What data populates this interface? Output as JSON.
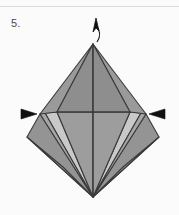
{
  "page": {
    "width": 179,
    "height": 215,
    "background_color": "#fbfbfb",
    "rule_color": "#d8dadd"
  },
  "step": {
    "number_label": "5."
  },
  "figure": {
    "title": "origami-kite-base-step-5",
    "stroke_color": "#3a3a3a",
    "stroke_width": 1.1,
    "arrow_color": "#111111",
    "colors": {
      "upper_face_left": "#8e8e8e",
      "upper_face_right": "#8e8e8e",
      "upper_wing_left": "#9a9a9a",
      "upper_wing_right": "#9a9a9a",
      "flap_outer_left": "#949494",
      "flap_outer_right": "#949494",
      "flap_light_left": "#c9c9c9",
      "flap_light_right": "#c9c9c9",
      "flap_mid_left": "#a6a6a6",
      "flap_mid_right": "#a6a6a6",
      "flap_inner_left": "#9d9d9d",
      "flap_inner_right": "#9d9d9d"
    },
    "vertices": {
      "top_apex": [
        93,
        44
      ],
      "bottom_apex": [
        93,
        197
      ],
      "left_point": [
        40,
        114
      ],
      "right_point": [
        146,
        114
      ],
      "crease_left": [
        57,
        112
      ],
      "crease_right": [
        130,
        112
      ],
      "outer_left_corner": [
        27,
        137
      ],
      "outer_right_corner": [
        159,
        137
      ]
    }
  },
  "annotations": {
    "top_arrow": {
      "name": "curved-up-arrow",
      "direction": "up",
      "style": "curved-outline"
    },
    "left_arrow": {
      "name": "pull-arrow-left",
      "direction": "right",
      "style": "solid-triangle"
    },
    "right_arrow": {
      "name": "pull-arrow-right",
      "direction": "left",
      "style": "solid-triangle"
    }
  }
}
